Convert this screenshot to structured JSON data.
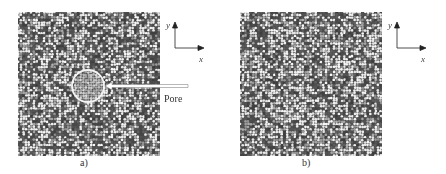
{
  "figure": {
    "panels": [
      {
        "id": "a",
        "caption": "a)",
        "has_pore": true,
        "box": {
          "x": 18,
          "y": 12,
          "w": 142,
          "h": 144
        },
        "pore": {
          "cx": 88,
          "cy": 86,
          "r": 16
        },
        "seed": 7
      },
      {
        "id": "b",
        "caption": "b)",
        "has_pore": false,
        "box": {
          "x": 240,
          "y": 12,
          "w": 142,
          "h": 144
        },
        "seed": 19
      }
    ],
    "annotation": {
      "label": "Pore",
      "arrow_from": {
        "x": 188,
        "y": 86
      },
      "arrow_to": {
        "x": 106,
        "y": 86
      }
    },
    "axes_a": {
      "x_label": "x",
      "y_label": "y",
      "origin": {
        "x": 175,
        "y": 48
      }
    },
    "axes_b": {
      "x_label": "x",
      "y_label": "y",
      "origin": {
        "x": 397,
        "y": 48
      }
    },
    "colors": {
      "background": "#ffffff",
      "dark_atom": "#555555",
      "light_atom": "#dcdcdc",
      "pore_fill": "#a8a8a8",
      "pore_ring": "#f4f4f4",
      "axis": "#222222"
    }
  }
}
